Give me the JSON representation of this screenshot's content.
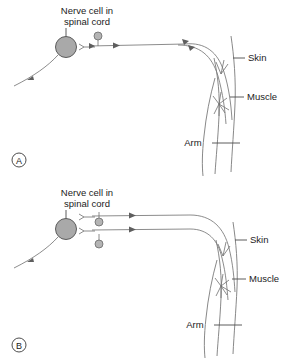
{
  "figure": {
    "title": "",
    "background_color": "#ffffff",
    "line_color": "#6e6e6e",
    "cell_fill_color": "#a9a9a9",
    "text_color": "#1b1b1b"
  },
  "panels": [
    {
      "id": "A",
      "letter": "A",
      "labels": {
        "nerve_cell_line1": "Nerve cell in",
        "nerve_cell_line2": "spinal cord",
        "skin": "Skin",
        "muscle": "Muscle",
        "arm": "Arm"
      },
      "pathway_count": 1,
      "vesicle_count": 1,
      "description": "Single sensory pathway from arm skin to nerve cell in spinal cord"
    },
    {
      "id": "B",
      "letter": "B",
      "labels": {
        "nerve_cell_line1": "Nerve cell in",
        "nerve_cell_line2": "spinal cord",
        "skin": "Skin",
        "muscle": "Muscle",
        "arm": "Arm"
      },
      "pathway_count": 2,
      "vesicle_count": 2,
      "description": "Two parallel sensory pathways from arm skin and muscle to nerve cell in spinal cord"
    }
  ],
  "icons": {
    "arrowhead": "arrowhead-icon",
    "synapse_terminal": "synapse-terminal-icon",
    "soma": "nerve-cell-body-icon",
    "vesicle": "vesicle-icon",
    "arm_outline": "arm-outline-icon",
    "nerve_branch": "nerve-branch-icon"
  }
}
